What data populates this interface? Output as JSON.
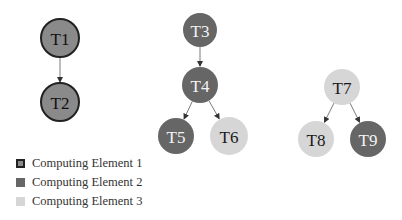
{
  "colors": {
    "ce1_fill": "#8a8a8a",
    "ce1_stroke": "#222222",
    "ce2_fill": "#666666",
    "ce3_fill": "#d6d6d6",
    "edge": "#7a7a7a"
  },
  "nodes": [
    {
      "id": "T1",
      "label": "T1",
      "cx": 60,
      "cy": 38,
      "r": 19,
      "element": 1
    },
    {
      "id": "T2",
      "label": "T2",
      "cx": 60,
      "cy": 102,
      "r": 19,
      "element": 1
    },
    {
      "id": "T3",
      "label": "T3",
      "cx": 200,
      "cy": 30,
      "r": 17,
      "element": 2
    },
    {
      "id": "T4",
      "label": "T4",
      "cx": 200,
      "cy": 85,
      "r": 18,
      "element": 2
    },
    {
      "id": "T5",
      "label": "T5",
      "cx": 176,
      "cy": 136,
      "r": 18,
      "element": 2
    },
    {
      "id": "T6",
      "label": "T6",
      "cx": 229,
      "cy": 136,
      "r": 19,
      "element": 3
    },
    {
      "id": "T7",
      "label": "T7",
      "cx": 342,
      "cy": 87,
      "r": 18,
      "element": 3
    },
    {
      "id": "T8",
      "label": "T8",
      "cx": 316,
      "cy": 139,
      "r": 18,
      "element": 3
    },
    {
      "id": "T9",
      "label": "T9",
      "cx": 368,
      "cy": 139,
      "r": 18,
      "element": 2
    }
  ],
  "edges": [
    {
      "from": "T1",
      "to": "T2"
    },
    {
      "from": "T3",
      "to": "T4"
    },
    {
      "from": "T4",
      "to": "T5"
    },
    {
      "from": "T4",
      "to": "T6"
    },
    {
      "from": "T7",
      "to": "T8"
    },
    {
      "from": "T7",
      "to": "T9"
    }
  ],
  "legend": {
    "items": [
      {
        "label": "Computing Element 1"
      },
      {
        "label": "Computing Element 2"
      },
      {
        "label": "Computing Element 3"
      }
    ]
  }
}
